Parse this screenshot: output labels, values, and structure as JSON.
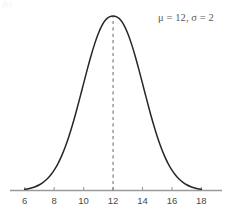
{
  "figure": {
    "panel_label": "(b)",
    "annotation": {
      "text": "μ = 12, σ = 2",
      "mu_label": "μ",
      "mu_value": "12",
      "sigma_label": "σ",
      "sigma_value": "2",
      "color": "#5a5a5a"
    }
  },
  "chart_data": {
    "type": "line",
    "title": "",
    "subtitle": "",
    "xlabel": "",
    "ylabel": "",
    "curve": "normal-distribution",
    "mu": 12,
    "sigma": 2,
    "xlim": [
      5.0,
      19.4
    ],
    "ylim": [
      0,
      0.2216
    ],
    "grid": false,
    "legend": null,
    "axis_color": "#9a9a9a",
    "curve_color": "#262626",
    "mean_line": {
      "x": 12,
      "style": "dashed",
      "color": "#777777",
      "from_y": 0,
      "to_y": 0.1995
    },
    "xticks": [
      6,
      8,
      10,
      12,
      14,
      16,
      18
    ],
    "xtick_labels": [
      "6",
      "8",
      "10",
      "12",
      "14",
      "16",
      "18"
    ],
    "yticks": [],
    "ytick_labels": [],
    "annotations": [
      {
        "text": "μ = 12, σ = 2",
        "x": 16.6,
        "y": 0.205
      }
    ],
    "x": [
      6.0,
      6.25,
      6.5,
      6.75,
      7.0,
      7.25,
      7.5,
      7.75,
      8.0,
      8.25,
      8.5,
      8.75,
      9.0,
      9.25,
      9.5,
      9.75,
      10.0,
      10.25,
      10.5,
      10.75,
      11.0,
      11.25,
      11.5,
      11.75,
      12.0,
      12.25,
      12.5,
      12.75,
      13.0,
      13.25,
      13.5,
      13.75,
      14.0,
      14.25,
      14.5,
      14.75,
      15.0,
      15.25,
      15.5,
      15.75,
      16.0,
      16.25,
      16.5,
      16.75,
      17.0,
      17.25,
      17.5,
      17.75,
      18.0
    ],
    "y": [
      0.0022,
      0.0034,
      0.0051,
      0.0076,
      0.011,
      0.0155,
      0.0214,
      0.029,
      0.0388,
      0.0508,
      0.0655,
      0.0829,
      0.103,
      0.1257,
      0.1505,
      0.1769,
      0.204,
      0.2308,
      0.2563,
      0.2793,
      0.299,
      0.3144,
      0.3251,
      0.3306,
      0.3324,
      0.3306,
      0.3251,
      0.3144,
      0.299,
      0.2793,
      0.2563,
      0.2308,
      0.204,
      0.1769,
      0.1505,
      0.1257,
      0.103,
      0.0829,
      0.0655,
      0.0508,
      0.0388,
      0.029,
      0.0214,
      0.0155,
      0.011,
      0.0076,
      0.0051,
      0.0034,
      0.0022
    ]
  }
}
